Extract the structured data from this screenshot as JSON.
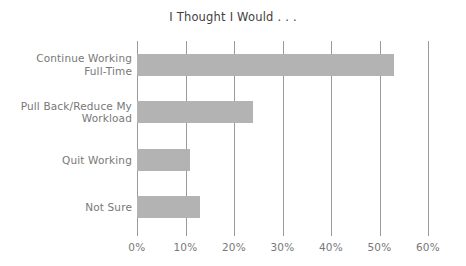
{
  "chart_data": {
    "type": "bar",
    "orientation": "horizontal",
    "title": "I Thought I Would . . .",
    "xlabel": "",
    "ylabel": "",
    "categories": [
      "Continue Working Full-Time",
      "Pull Back/Reduce My Workload",
      "Quit Working",
      "Not Sure"
    ],
    "category_lines": [
      [
        "Continue Working",
        "Full-Time"
      ],
      [
        "Pull Back/Reduce My",
        "Workload"
      ],
      [
        "Quit Working"
      ],
      [
        "Not Sure"
      ]
    ],
    "values": [
      53,
      24,
      11,
      13
    ],
    "value_labels": [
      "53%",
      "24%",
      "11%",
      "13%"
    ],
    "xlim": [
      0,
      60
    ],
    "xticks": [
      0,
      10,
      20,
      30,
      40,
      50,
      60
    ],
    "xtick_labels": [
      "0%",
      "10%",
      "20%",
      "30%",
      "40%",
      "50%",
      "60%"
    ],
    "grid": true,
    "grid_axis": "x",
    "legend": false,
    "legend_position": "none",
    "bar_color": "#b3b3b3",
    "grid_color": "#9a9a9a",
    "title_color": "#3f3f3f",
    "label_color": "#787878",
    "background": "#ffffff"
  }
}
